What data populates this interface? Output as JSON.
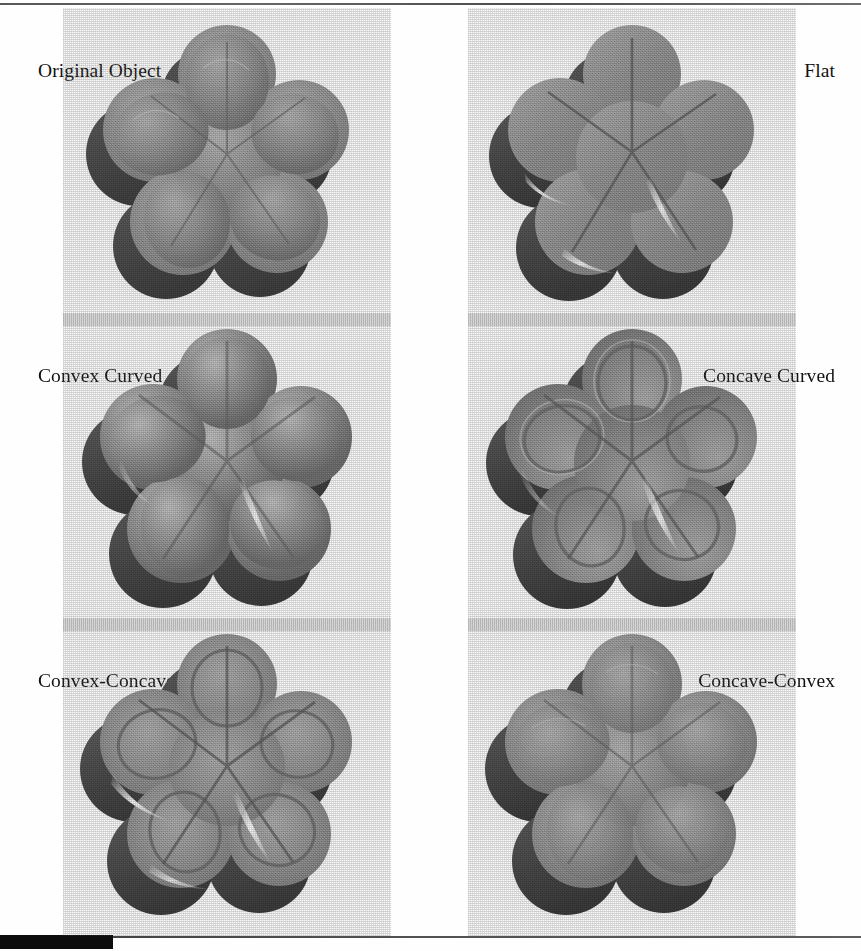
{
  "figure": {
    "kind": "shape-rendering-comparison",
    "background_color": "#fefefe",
    "rows": 3,
    "columns": 2,
    "scan_rule_color": "#3a3a3a",
    "scan_artifact_color": "#0d0d0d"
  },
  "palette": {
    "top_face": "#8e8e8e",
    "top_face_light": "#a9a9a9",
    "top_face_dark": "#6f6f6f",
    "side_wall": "#4d4d4d",
    "side_wall_dark": "#3a3a3a",
    "cast_shadow": "#474747",
    "specular_highlight": "#f2f2f2",
    "rim_highlight": "#d8d8d8",
    "crease": "#5a5a5a",
    "paper": "#fefefe",
    "text": "#111111"
  },
  "panels": [
    {
      "id": "original-object",
      "label": "Original Object",
      "label_align": "left",
      "row": 1,
      "column": 1,
      "surface": "smooth-rounded",
      "edge": "rounded",
      "petals": 5,
      "has_inner_ridge": false,
      "has_specular_streak": false
    },
    {
      "id": "flat",
      "label": "Flat",
      "label_align": "right",
      "row": 1,
      "column": 2,
      "surface": "flat-top",
      "edge": "sharp-bevel",
      "petals": 5,
      "has_inner_ridge": false,
      "has_specular_streak": true
    },
    {
      "id": "convex-curved",
      "label": "Convex Curved",
      "label_align": "left",
      "row": 2,
      "column": 1,
      "surface": "convex",
      "edge": "rounded",
      "petals": 5,
      "has_inner_ridge": false,
      "has_specular_streak": true
    },
    {
      "id": "concave-curved",
      "label": "Concave Curved",
      "label_align": "right",
      "row": 2,
      "column": 2,
      "surface": "concave",
      "edge": "raised-rim",
      "petals": 5,
      "has_inner_ridge": true,
      "has_specular_streak": true
    },
    {
      "id": "convex-concave",
      "label": "Convex-Concave",
      "label_align": "left",
      "row": 3,
      "column": 1,
      "surface": "convex-then-concave",
      "edge": "raised-rim",
      "petals": 5,
      "has_inner_ridge": true,
      "has_specular_streak": true
    },
    {
      "id": "concave-convex",
      "label": "Concave-Convex",
      "label_align": "right",
      "row": 3,
      "column": 2,
      "surface": "concave-then-convex",
      "edge": "soft-rounded",
      "petals": 5,
      "has_inner_ridge": false,
      "has_specular_streak": false
    }
  ]
}
